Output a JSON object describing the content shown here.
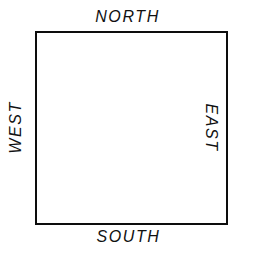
{
  "figure": {
    "kind": "cardinal-directions-square-diagram",
    "background_color": "#ffffff",
    "line_color": "#0d0d0d",
    "text_color": "#111111"
  },
  "square": {
    "name": "compass-square",
    "border_width_px": 2,
    "width_px": 193,
    "height_px": 194,
    "left_px": 35,
    "top_px": 31
  },
  "labels": {
    "north": "NORTH",
    "south": "SOUTH",
    "west": "WEST",
    "east": "EAST"
  }
}
